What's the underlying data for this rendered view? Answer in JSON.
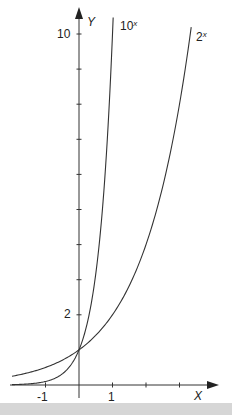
{
  "chart_data": {
    "type": "line",
    "title": "",
    "xlabel": "X",
    "ylabel": "Y",
    "x_ticks": [
      -1,
      1,
      2,
      3
    ],
    "x_tick_labels": [
      "-1",
      "1"
    ],
    "y_ticks": [
      2,
      3,
      4,
      5,
      6,
      7,
      8,
      9,
      10
    ],
    "y_tick_labels": [
      "2",
      "10"
    ],
    "xlim": [
      -2,
      4
    ],
    "ylim": [
      0,
      10.5
    ],
    "grid": false,
    "legend": "inline labels at curve ends",
    "series": [
      {
        "name": "10^x",
        "label_base": "10",
        "label_exp": "x",
        "x": [
          -2,
          -1.5,
          -1,
          -0.5,
          0,
          0.25,
          0.5,
          0.75,
          1,
          1.02
        ],
        "values": [
          0.01,
          0.032,
          0.1,
          0.316,
          1,
          1.778,
          3.162,
          5.623,
          10,
          10.47
        ]
      },
      {
        "name": "2^x",
        "label_base": "2",
        "label_exp": "x",
        "x": [
          -2,
          -1.5,
          -1,
          -0.5,
          0,
          0.5,
          1,
          1.5,
          2,
          2.5,
          3,
          3.35
        ],
        "values": [
          0.25,
          0.354,
          0.5,
          0.707,
          1,
          1.414,
          2,
          2.828,
          4,
          5.657,
          8,
          10.2
        ]
      }
    ],
    "annotations": [
      "curves intersect at (0, 1)"
    ]
  },
  "labels": {
    "x_axis": "X",
    "y_axis": "Y",
    "tick_neg1": "-1",
    "tick_1": "1",
    "tick_2": "2",
    "tick_10": "10",
    "curve_10x_base": "10",
    "curve_2x_base": "2",
    "curve_exp": "x"
  }
}
